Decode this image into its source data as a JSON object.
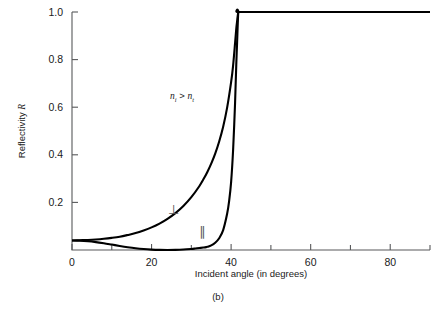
{
  "figure": {
    "caption": "(b)",
    "annotation": {
      "n": "n",
      "sub_i": "i",
      "operator": ">",
      "sub_t": "t",
      "full": "n_i > n_t"
    }
  },
  "chart_data": {
    "type": "line",
    "title": "",
    "subtitle": "",
    "xlabel": "Incident angle (in degrees)",
    "ylabel": "Reflectivity R",
    "xlim": [
      0,
      90
    ],
    "ylim": [
      0,
      1.0
    ],
    "grid": false,
    "legend_position": "inline-annotation",
    "xticks": [
      0,
      20,
      40,
      60,
      80
    ],
    "xtick_labels": [
      "0",
      "20",
      "40",
      "60",
      "80"
    ],
    "xminor_ticks": [
      10,
      30,
      50,
      70,
      90
    ],
    "yticks": [
      0.2,
      0.4,
      0.6,
      0.8,
      1.0
    ],
    "ytick_labels": [
      "0.2",
      "0.4",
      "0.6",
      "0.8",
      "1.0"
    ],
    "annotations": [
      {
        "text": "n_i > n_t",
        "x": 30,
        "y": 0.63,
        "name": "index-condition"
      },
      {
        "text": "⊥",
        "x": 29.5,
        "y": 0.205,
        "name": "perpendicular-polarization-label"
      },
      {
        "text": "∥",
        "x": 37.5,
        "y": 0.115,
        "name": "parallel-polarization-label"
      }
    ],
    "critical_angle": 41.8,
    "brewster_angle": 33.7,
    "series": [
      {
        "name": "perpendicular",
        "symbol": "⊥",
        "x": [
          0,
          2,
          4,
          6,
          8,
          10,
          12,
          14,
          16,
          18,
          20,
          22,
          24,
          26,
          28,
          30,
          32,
          33,
          34,
          35,
          36,
          37,
          38,
          39,
          40,
          40.5,
          41,
          41.3,
          41.5,
          41.8,
          42,
          50,
          60,
          70,
          80,
          90
        ],
        "values": [
          0.04,
          0.041,
          0.042,
          0.044,
          0.047,
          0.051,
          0.056,
          0.063,
          0.071,
          0.082,
          0.095,
          0.111,
          0.131,
          0.155,
          0.185,
          0.222,
          0.268,
          0.296,
          0.327,
          0.363,
          0.405,
          0.456,
          0.518,
          0.598,
          0.705,
          0.775,
          0.87,
          0.93,
          0.96,
          1.0,
          1.0,
          1.0,
          1.0,
          1.0,
          1.0,
          1.0
        ]
      },
      {
        "name": "parallel",
        "symbol": "∥",
        "x": [
          0,
          2,
          4,
          6,
          8,
          10,
          12,
          14,
          16,
          18,
          20,
          22,
          24,
          26,
          28,
          30,
          31,
          32,
          33,
          33.7,
          34,
          35,
          36,
          37,
          38,
          39,
          39.5,
          40,
          40.5,
          41,
          41.3,
          41.5,
          41.8,
          42,
          50,
          60,
          70,
          80,
          90
        ],
        "values": [
          0.04,
          0.0392,
          0.0368,
          0.0331,
          0.0283,
          0.0228,
          0.0171,
          0.0118,
          0.0073,
          0.0039,
          0.0017,
          0.0005,
          0.0001,
          0.0005,
          0.0019,
          0.0045,
          0.0063,
          0.0083,
          0.0104,
          0.012,
          0.0132,
          0.0195,
          0.0305,
          0.0495,
          0.0835,
          0.152,
          0.205,
          0.285,
          0.42,
          0.62,
          0.78,
          0.87,
          1.0,
          1.0,
          1.0,
          1.0,
          1.0,
          1.0,
          1.0
        ]
      }
    ]
  }
}
